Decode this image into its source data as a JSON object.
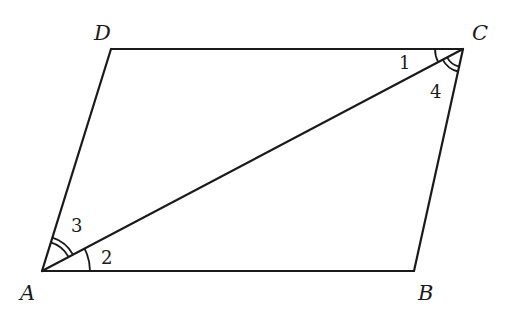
{
  "diagram": {
    "type": "parallelogram",
    "vertices": {
      "A": {
        "label": "A",
        "x": 42,
        "y": 271
      },
      "B": {
        "label": "B",
        "x": 414,
        "y": 271
      },
      "C": {
        "label": "C",
        "x": 463,
        "y": 49
      },
      "D": {
        "label": "D",
        "x": 111,
        "y": 49
      }
    },
    "edges": [
      "AB",
      "BC",
      "CD",
      "DA",
      "AC"
    ],
    "angles": [
      {
        "label": "1",
        "vertex": "C",
        "between": [
          "CD",
          "CA"
        ],
        "arcs": 1
      },
      {
        "label": "2",
        "vertex": "A",
        "between": [
          "AB",
          "AC"
        ],
        "arcs": 1
      },
      {
        "label": "3",
        "vertex": "A",
        "between": [
          "AD",
          "AC"
        ],
        "arcs": 2
      },
      {
        "label": "4",
        "vertex": "C",
        "between": [
          "CB",
          "CA"
        ],
        "arcs": 2
      }
    ],
    "stroke_color": "#1a1a1a"
  }
}
